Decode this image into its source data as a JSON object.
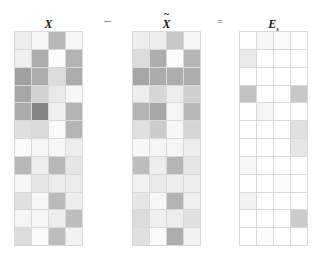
{
  "figure": {
    "grid_rows": 12,
    "grid_cols": 4,
    "grid_line_color": "#d9d9d9",
    "background_color": "#ffffff",
    "colormap": "grayscale"
  },
  "operators": {
    "minus": "–",
    "equals": "="
  },
  "matrices": [
    {
      "id": "matrix-x",
      "label_text": "X",
      "label_base": "X",
      "label_tilde": "",
      "label_subscript": "",
      "x": 14,
      "y": 31,
      "width": 69,
      "height": 215,
      "values": [
        [
          0.93,
          0.97,
          0.72,
          0.96
        ],
        [
          0.94,
          0.68,
          0.99,
          0.7
        ],
        [
          0.63,
          0.68,
          0.86,
          0.68
        ],
        [
          0.65,
          0.82,
          0.91,
          0.97
        ],
        [
          0.67,
          0.52,
          0.94,
          0.7
        ],
        [
          0.87,
          0.85,
          0.98,
          0.71
        ],
        [
          0.98,
          0.96,
          0.97,
          0.93
        ],
        [
          0.72,
          0.93,
          0.72,
          0.9
        ],
        [
          0.97,
          0.9,
          0.92,
          0.92
        ],
        [
          0.88,
          0.97,
          0.73,
          0.93
        ],
        [
          0.96,
          0.96,
          0.93,
          0.74
        ],
        [
          0.86,
          0.98,
          0.74,
          0.95
        ]
      ]
    },
    {
      "id": "matrix-x-tilde",
      "label_text": "X̃",
      "label_base": "X",
      "label_tilde": "~",
      "label_subscript": "",
      "x": 132,
      "y": 31,
      "width": 69,
      "height": 215,
      "values": [
        [
          0.93,
          0.93,
          0.78,
          0.96
        ],
        [
          0.86,
          0.68,
          0.99,
          0.71
        ],
        [
          0.65,
          0.67,
          0.68,
          0.68
        ],
        [
          0.93,
          0.84,
          0.93,
          0.81
        ],
        [
          0.7,
          0.65,
          0.96,
          0.72
        ],
        [
          0.88,
          0.8,
          0.97,
          0.84
        ],
        [
          0.97,
          0.96,
          0.96,
          0.93
        ],
        [
          0.74,
          0.93,
          0.71,
          0.9
        ],
        [
          0.95,
          0.91,
          0.93,
          0.93
        ],
        [
          0.9,
          0.97,
          0.7,
          0.94
        ],
        [
          0.86,
          0.94,
          0.93,
          0.88
        ],
        [
          0.88,
          0.98,
          0.68,
          0.95
        ]
      ]
    },
    {
      "id": "matrix-e",
      "label_text": "Es",
      "label_base": "E",
      "label_tilde": "",
      "label_subscript": "s",
      "x": 239,
      "y": 31,
      "width": 69,
      "height": 215,
      "values": [
        [
          1.0,
          0.97,
          0.98,
          1.0
        ],
        [
          0.91,
          1.0,
          1.0,
          1.0
        ],
        [
          1.0,
          1.0,
          1.0,
          1.0
        ],
        [
          0.76,
          1.0,
          1.0,
          0.78
        ],
        [
          1.0,
          0.96,
          1.0,
          1.0
        ],
        [
          1.0,
          1.0,
          1.0,
          0.88
        ],
        [
          1.0,
          1.0,
          1.0,
          0.9
        ],
        [
          0.97,
          1.0,
          1.0,
          1.0
        ],
        [
          1.0,
          1.0,
          0.99,
          1.0
        ],
        [
          0.95,
          1.0,
          1.0,
          1.0
        ],
        [
          1.0,
          1.0,
          1.0,
          0.8
        ],
        [
          1.0,
          0.99,
          1.0,
          1.0
        ]
      ]
    }
  ]
}
